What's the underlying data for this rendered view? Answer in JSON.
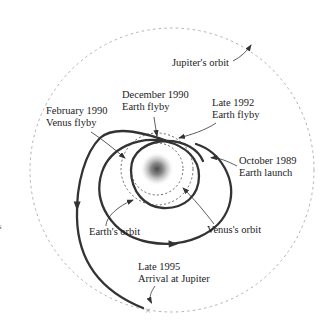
{
  "diagram": {
    "type": "orbital-trajectory-diagram",
    "labels": {
      "jupiter_orbit": "Jupiter's orbit",
      "december_1990": {
        "line1": "December 1990",
        "line2": "Earth flyby"
      },
      "late_1992": {
        "line1": "Late 1992",
        "line2": "Earth flyby"
      },
      "february_1990": {
        "line1": "February 1990",
        "line2": "Venus flyby"
      },
      "october_1989": {
        "line1": "October 1989",
        "line2": "Earth launch"
      },
      "earth_orbit": "Earth's orbit",
      "venus_orbit": "Venus's orbit",
      "late_1995": {
        "line1": "Late 1995",
        "line2": "Arrival at Jupiter"
      }
    },
    "markers": {
      "arrival_x": "×"
    },
    "edge_fragment": "s",
    "colors": {
      "trajectory": "#333333",
      "jupiter_orbit_dash": "#b0b0b0",
      "inner_orbit_dash": "#555555",
      "leader_line": "#333333",
      "text": "#1c1c1c",
      "sun_core": "#4a4a4a",
      "arrival_mark": "#999999"
    }
  }
}
